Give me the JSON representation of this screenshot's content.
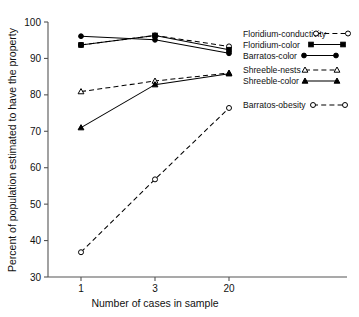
{
  "chart_data": {
    "type": "line",
    "title": "",
    "xlabel": "Number of cases in sample",
    "ylabel": "Percent of population estimated to have the property",
    "x": [
      1,
      3,
      20
    ],
    "x_tick_labels": [
      "1",
      "3",
      "20"
    ],
    "y_tick_labels": [
      "30",
      "40",
      "50",
      "60",
      "70",
      "80",
      "90",
      "100"
    ],
    "y_ticks": [
      30,
      40,
      50,
      60,
      70,
      80,
      90,
      100
    ],
    "ylim": [
      30,
      100
    ],
    "grid": false,
    "legend_position": "right-inside",
    "series": [
      {
        "name": "Floridium-conductivity",
        "values": [
          93.7,
          96.3,
          93.3
        ],
        "marker": "open-circle",
        "line_style": "dashed",
        "color": "#000000"
      },
      {
        "name": "Floridium-color",
        "values": [
          93.7,
          96.3,
          92.4
        ],
        "marker": "filled-square",
        "line_style": "solid",
        "color": "#000000"
      },
      {
        "name": "Barratos-color",
        "values": [
          96.1,
          95.1,
          91.4
        ],
        "marker": "filled-circle",
        "line_style": "solid",
        "color": "#000000"
      },
      {
        "name": "Shreeble-nests",
        "values": [
          80.9,
          83.8,
          86.0
        ],
        "marker": "open-triangle",
        "line_style": "dashed",
        "color": "#000000"
      },
      {
        "name": "Shreeble-color",
        "values": [
          71.0,
          82.8,
          85.8
        ],
        "marker": "filled-triangle",
        "line_style": "solid",
        "color": "#000000"
      },
      {
        "name": "Barratos-obesity",
        "values": [
          36.8,
          56.8,
          76.4
        ],
        "marker": "open-circle",
        "line_style": "dashed",
        "color": "#000000"
      }
    ]
  },
  "legend": {
    "entries": [
      {
        "label": "Floridium-conductivity",
        "key": "floridium-conductivity"
      },
      {
        "label": "Floridium-color",
        "key": "floridium-color"
      },
      {
        "label": "Barratos-color",
        "key": "barratos-color"
      },
      {
        "label": "Shreeble-nests",
        "key": "shreeble-nests"
      },
      {
        "label": "Shreeble-color",
        "key": "shreeble-color"
      },
      {
        "label": "Barratos-obesity",
        "key": "barratos-obesity"
      }
    ]
  },
  "style": {
    "axis_color": "#555555",
    "ink_color": "#000000",
    "background": "#ffffff"
  }
}
